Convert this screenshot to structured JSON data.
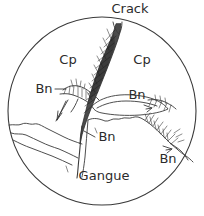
{
  "figure": {
    "kind": "hand-drawn-photomicrograph-sketch",
    "field_of_view": "circular",
    "stroke_color": "#3a3a3a",
    "vein_fill_color": "#4a4a4a",
    "background_color": "#ffffff",
    "circle": {
      "cx": 102,
      "cy": 111,
      "r": 94
    }
  },
  "labels": {
    "crack": {
      "text": "Crack",
      "x": 130,
      "y": 13
    },
    "cp_left": {
      "text": "Cp",
      "x": 68,
      "y": 64
    },
    "cp_right": {
      "text": "Cp",
      "x": 138,
      "y": 64
    },
    "bn_left": {
      "text": "Bn",
      "x": 43,
      "y": 92
    },
    "bn_right": {
      "text": "Bn",
      "x": 137,
      "y": 96
    },
    "bn_center": {
      "text": "Bn",
      "x": 104,
      "y": 139
    },
    "bn_lower_right": {
      "text": "Bn",
      "x": 167,
      "y": 161
    },
    "gangue": {
      "text": "Gangue",
      "x": 104,
      "y": 179
    }
  },
  "mineral_keys": [
    {
      "abbrev": "Cp",
      "count": 2
    },
    {
      "abbrev": "Bn",
      "count": 4
    },
    {
      "abbrev": "Gangue",
      "count": 1
    },
    {
      "abbrev": "Crack",
      "count": 1
    }
  ]
}
